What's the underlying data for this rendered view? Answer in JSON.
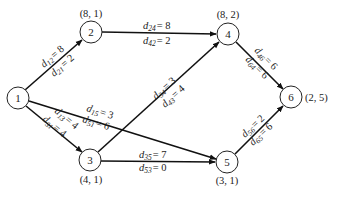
{
  "diagram": {
    "type": "directed-network",
    "nodes": [
      {
        "id": "1",
        "label": "1",
        "coord": "",
        "x": 18,
        "y": 98
      },
      {
        "id": "2",
        "label": "2",
        "coord": "(8, 1)",
        "x": 91,
        "y": 32
      },
      {
        "id": "3",
        "label": "3",
        "coord": "(4, 1)",
        "x": 90,
        "y": 160
      },
      {
        "id": "4",
        "label": "4",
        "coord": "(8, 2)",
        "x": 228,
        "y": 34
      },
      {
        "id": "5",
        "label": "5",
        "coord": "(3, 1)",
        "x": 227,
        "y": 162
      },
      {
        "id": "6",
        "label": "6",
        "coord": "(2, 5)",
        "x": 291,
        "y": 97
      }
    ],
    "edges": [
      {
        "from": "1",
        "to": "2",
        "fwd": {
          "sub": "12",
          "val": "= 8"
        },
        "back": {
          "sub": "21",
          "val": "= 2"
        }
      },
      {
        "from": "1",
        "to": "3",
        "fwd": {
          "sub": "13",
          "val": "= 4"
        },
        "back": {
          "sub": "31",
          "val": "= 4"
        }
      },
      {
        "from": "1",
        "to": "5",
        "fwd": {
          "sub": "15",
          "val": "= 3"
        },
        "back": {
          "sub": "51",
          "val": "= 6"
        }
      },
      {
        "from": "2",
        "to": "4",
        "fwd": {
          "sub": "24",
          "val": "= 8"
        },
        "back": {
          "sub": "42",
          "val": "= 2"
        }
      },
      {
        "from": "3",
        "to": "4",
        "fwd": {
          "sub": "34",
          "val": "= 3"
        },
        "back": {
          "sub": "43",
          "val": "= 4"
        }
      },
      {
        "from": "3",
        "to": "5",
        "fwd": {
          "sub": "35",
          "val": "= 7"
        },
        "back": {
          "sub": "53",
          "val": "= 0"
        }
      },
      {
        "from": "4",
        "to": "6",
        "fwd": {
          "sub": "46",
          "val": "= 6"
        },
        "back": {
          "sub": "64",
          "val": "= 6"
        }
      },
      {
        "from": "5",
        "to": "6",
        "fwd": {
          "sub": "56",
          "val": "= 2"
        },
        "back": {
          "sub": "65",
          "val": "= 6"
        }
      }
    ],
    "label_var": "d"
  }
}
